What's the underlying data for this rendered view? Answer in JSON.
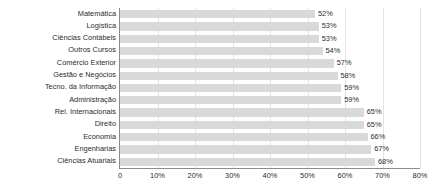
{
  "chart_data": {
    "type": "bar",
    "orientation": "horizontal",
    "title": "",
    "subtitle": "",
    "xlabel": "",
    "ylabel": "",
    "xlim": [
      0,
      80
    ],
    "grid": true,
    "legend": false,
    "legend_position": "none",
    "xticks": [
      "0",
      "10%",
      "20%",
      "30%",
      "40%",
      "50%",
      "60%",
      "70%",
      "80%"
    ],
    "xtick_values": [
      0,
      10,
      20,
      30,
      40,
      50,
      60,
      70,
      80
    ],
    "categories": [
      "Matemática",
      "Logística",
      "Ciências Contábeis",
      "Outros Cursos",
      "Comércio Exterior",
      "Gestão e Negócios",
      "Tecno. da Informação",
      "Administração",
      "Rel. Internacionais",
      "Direito",
      "Economia",
      "Engenharias",
      "Ciências Atuariais"
    ],
    "values": [
      52,
      53,
      53,
      54,
      57,
      58,
      59,
      59,
      65,
      65,
      66,
      67,
      68
    ],
    "data_labels": [
      "52%",
      "53%",
      "53%",
      "54%",
      "57%",
      "58%",
      "59%",
      "59%",
      "65%",
      "65%",
      "66%",
      "67%",
      "68%"
    ],
    "colors": {
      "bar": "#d9d9d9",
      "axis": "#8c8c8c",
      "grid": "#e3e3e3",
      "text": "#2b2b2b",
      "background": "#ffffff"
    }
  }
}
